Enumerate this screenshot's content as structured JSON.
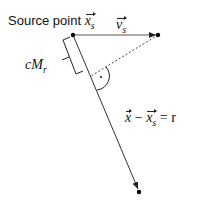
{
  "diagram": {
    "title_label": {
      "prefix": "Source point",
      "vector": "x",
      "subscript": "s"
    },
    "velocity_label": {
      "vector": "v",
      "subscript": "s"
    },
    "bracket_label": {
      "c": "c",
      "M": "M",
      "subscript": "r"
    },
    "equation_label": {
      "lhs_vector1": "x",
      "minus": "−",
      "lhs_vector2": "x",
      "subscript": "s",
      "equals": "=",
      "rhs": "r"
    },
    "points": {
      "source": [
        73,
        35
      ],
      "velocity_tip": [
        158,
        35
      ],
      "foot": [
        91,
        76
      ],
      "target": [
        139,
        192
      ]
    },
    "colors": {
      "line": "#333333",
      "point": "#000000",
      "text": "#111111"
    }
  }
}
